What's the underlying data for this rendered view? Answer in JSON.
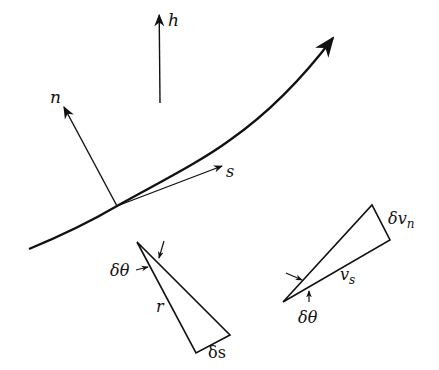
{
  "diagram": {
    "curve": {
      "name": "streamline",
      "points": [
        [
          29,
          249
        ],
        [
          117,
          206
        ],
        [
          200,
          160
        ],
        [
          335,
          35
        ]
      ]
    },
    "vectors": [
      {
        "id": "h",
        "label": "h",
        "from": [
          160,
          103
        ],
        "to": [
          159,
          14
        ]
      },
      {
        "id": "n",
        "label": "n",
        "from": [
          117,
          206
        ],
        "to": [
          63,
          106
        ]
      },
      {
        "id": "s",
        "label": "s",
        "from": [
          117,
          206
        ],
        "to": [
          222,
          166
        ]
      }
    ],
    "geometry_triangle": {
      "angle_label": "δθ",
      "side_label": "r",
      "arc_label": "δs",
      "vertices": [
        [
          137,
          242
        ],
        [
          196,
          353
        ],
        [
          230,
          335
        ]
      ]
    },
    "velocity_triangle": {
      "angle_label": "δθ",
      "side_label": "v",
      "side_subscript": "s",
      "change_label": "δv",
      "change_subscript": "n",
      "vertices": [
        [
          283,
          302
        ],
        [
          372,
          205
        ],
        [
          390,
          240
        ]
      ]
    },
    "colors": {
      "ink": "#111111",
      "background": "#ffffff"
    }
  }
}
